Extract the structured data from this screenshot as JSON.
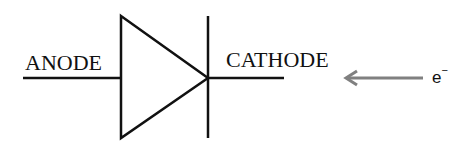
{
  "diagram": {
    "labels": {
      "anode": "ANODE",
      "cathode": "CATHODE",
      "electron": "e",
      "electron_charge": "−"
    },
    "colors": {
      "stroke": "#111111",
      "arrow": "#808080"
    }
  }
}
